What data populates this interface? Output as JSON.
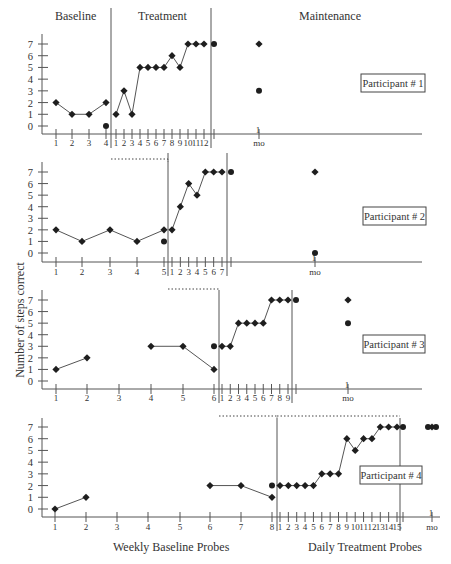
{
  "chart_data": {
    "type": "line",
    "phases": [
      "Baseline",
      "Treatment",
      "Maintenance"
    ],
    "ylabel": "Number of steps correct",
    "xlabel_left": "Weekly Baseline Probes",
    "xlabel_right": "Daily Treatment Probes",
    "ylim": [
      0,
      7
    ],
    "yticks": [
      "0",
      "1",
      "2",
      "3",
      "4",
      "5",
      "6",
      "7"
    ],
    "maintenance_tick_label": "mo",
    "maintenance_tick_number": "1",
    "panels": [
      {
        "label": "Participant # 1",
        "baseline": {
          "x": [
            "1",
            "2",
            "3",
            "4"
          ],
          "values": [
            2,
            1,
            1,
            2
          ],
          "extra_point": {
            "x": "4",
            "value": 0
          }
        },
        "treatment": {
          "x": [
            "1",
            "2",
            "3",
            "4",
            "5",
            "6",
            "7",
            "8",
            "9",
            "10",
            "11",
            "12"
          ],
          "values": [
            1,
            3,
            1,
            5,
            5,
            5,
            5,
            6,
            5,
            7,
            7,
            7
          ]
        },
        "post_treatment_point": 7,
        "maintenance": {
          "x": "1 mo",
          "values": [
            7,
            3
          ]
        }
      },
      {
        "label": "Participant # 2",
        "baseline": {
          "x": [
            "1",
            "2",
            "3",
            "4",
            "5"
          ],
          "values": [
            2,
            1,
            2,
            1,
            2
          ],
          "extra_point": {
            "x": "5",
            "value": 1
          }
        },
        "treatment": {
          "x": [
            "1",
            "2",
            "3",
            "4",
            "5",
            "6",
            "7"
          ],
          "values": [
            2,
            4,
            6,
            5,
            7,
            7,
            7
          ]
        },
        "post_treatment_point": 7,
        "maintenance": {
          "x": "1 mo",
          "values": [
            7,
            0
          ]
        }
      },
      {
        "label": "Participant # 3",
        "baseline": {
          "x": [
            "1",
            "2",
            "3",
            "4",
            "5",
            "6"
          ],
          "values": [
            1,
            2,
            null,
            3,
            3,
            1
          ],
          "extra_point": {
            "x": "6",
            "value": 3
          }
        },
        "treatment": {
          "x": [
            "1",
            "2",
            "3",
            "4",
            "5",
            "6",
            "7",
            "8",
            "9"
          ],
          "values": [
            3,
            3,
            5,
            5,
            5,
            5,
            7,
            7,
            7
          ]
        },
        "post_treatment_point": 7,
        "maintenance": {
          "x": "1 mo",
          "values": [
            7,
            5
          ]
        }
      },
      {
        "label": "Participant # 4",
        "baseline": {
          "x": [
            "1",
            "2",
            "3",
            "4",
            "5",
            "6",
            "7",
            "8"
          ],
          "values": [
            0,
            1,
            null,
            null,
            null,
            2,
            2,
            1
          ],
          "extra_point": {
            "x": "8",
            "value": 2
          }
        },
        "treatment": {
          "x": [
            "1",
            "2",
            "3",
            "4",
            "5",
            "6",
            "7",
            "8",
            "9",
            "10",
            "11",
            "12",
            "13",
            "14",
            "15"
          ],
          "values": [
            2,
            2,
            2,
            2,
            2,
            3,
            3,
            3,
            6,
            5,
            6,
            6,
            7,
            7,
            7
          ]
        },
        "post_treatment_point": 7,
        "maintenance": {
          "x": "1 mo",
          "values": [
            7,
            7
          ]
        }
      }
    ]
  }
}
